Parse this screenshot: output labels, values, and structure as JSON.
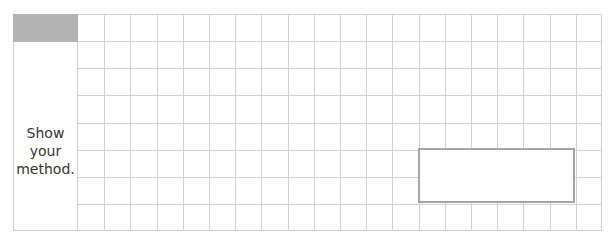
{
  "worksheet": {
    "prompt_lines": [
      "Show",
      "your",
      "method."
    ],
    "grid": {
      "columns": 20,
      "rows": 8
    },
    "answer_box": {
      "columns": 6,
      "rows": 2,
      "value": ""
    },
    "colors": {
      "header_fill": "#b3b3b3",
      "grid_line": "#d2d2d2",
      "answer_border": "#a6a6a6",
      "text": "#333333"
    }
  }
}
